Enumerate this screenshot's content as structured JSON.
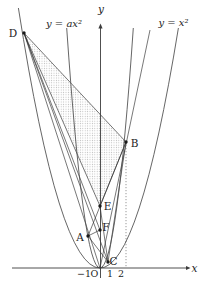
{
  "figure": {
    "colors": {
      "background": "#ffffff",
      "line": "#2f2f2f",
      "curve": "#4a4a4a",
      "shade_dot": "#b8b8b8"
    },
    "axis_labels": {
      "x": "x",
      "y": "y"
    },
    "curve_labels": {
      "narrow": "y = ax²",
      "wide": "y = x²"
    },
    "curves": {
      "wide_left": "M 18.4 8 Q 59.2 268 100 268",
      "wide_right": "M 100 268 Q 139.2 268 178.4 28",
      "narrow_left": "M 66.7 28 Q 83.3 268 100 268",
      "narrow_right": "M 100 268 Q 116.7 268 133.3 28"
    },
    "shade": {
      "points": "24,33 126,142 100,206"
    },
    "segments": [
      {
        "name": "D-B",
        "x1": 24,
        "y1": 33,
        "x2": 126,
        "y2": 142
      },
      {
        "name": "D-E",
        "x1": 24,
        "y1": 33,
        "x2": 100,
        "y2": 206
      },
      {
        "name": "B-E",
        "x1": 126,
        "y1": 142,
        "x2": 100,
        "y2": 206
      },
      {
        "name": "D-F",
        "x1": 24,
        "y1": 33,
        "x2": 100,
        "y2": 230
      },
      {
        "name": "D-O",
        "x1": 24,
        "y1": 33,
        "x2": 100,
        "y2": 268
      },
      {
        "name": "D-C",
        "x1": 24,
        "y1": 33,
        "x2": 108,
        "y2": 262
      },
      {
        "name": "A-B",
        "x1": 88,
        "y1": 236,
        "x2": 126,
        "y2": 142
      },
      {
        "name": "A-F",
        "x1": 88,
        "y1": 236,
        "x2": 100,
        "y2": 230
      },
      {
        "name": "A-C",
        "x1": 88,
        "y1": 236,
        "x2": 108,
        "y2": 262
      },
      {
        "name": "B-C",
        "x1": 126,
        "y1": 142,
        "x2": 108,
        "y2": 262
      },
      {
        "name": "E-C",
        "x1": 100,
        "y1": 206,
        "x2": 108,
        "y2": 262
      },
      {
        "name": "O-B-extended",
        "x1": 100,
        "y1": 268,
        "x2": 150,
        "y2": 30
      },
      {
        "name": "B-vertical-drop",
        "x1": 126,
        "y1": 142,
        "x2": 126,
        "y2": 267,
        "dashed": true
      }
    ],
    "points": [
      {
        "label": "D",
        "x": 24,
        "y": 33,
        "lx": 13,
        "ly": 37
      },
      {
        "label": "B",
        "x": 126,
        "y": 142,
        "lx": 134.5,
        "ly": 147
      },
      {
        "label": "E",
        "x": 100,
        "y": 206,
        "lx": 107.5,
        "ly": 210
      },
      {
        "label": "F",
        "x": 100,
        "y": 230,
        "lx": 106,
        "ly": 231
      },
      {
        "label": "A",
        "x": 88,
        "y": 236,
        "lx": 80,
        "ly": 241
      },
      {
        "label": "C",
        "x": 108,
        "y": 262,
        "lx": 113.5,
        "ly": 265
      }
    ],
    "ticks": [
      {
        "text": "−1",
        "x": 84,
        "y": 277
      },
      {
        "text": "O",
        "x": 94.5,
        "y": 277
      },
      {
        "text": "1",
        "x": 110,
        "y": 277
      },
      {
        "text": "2",
        "x": 121,
        "y": 277
      }
    ]
  }
}
